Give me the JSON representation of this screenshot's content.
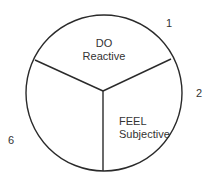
{
  "diagram": {
    "type": "segmented-circle",
    "stroke_color": "#2a2a2a",
    "text_color": "#333333",
    "segments": [
      {
        "id": "top",
        "title": "DO",
        "subtitle": "Reactive"
      },
      {
        "id": "bottom-right",
        "title": "FEEL",
        "subtitle": "Subjective"
      },
      {
        "id": "bottom-left",
        "title": "",
        "subtitle": ""
      }
    ],
    "numbers": [
      {
        "label": "1",
        "position": "top-right"
      },
      {
        "label": "2",
        "position": "right"
      },
      {
        "label": "6",
        "position": "left"
      }
    ]
  }
}
